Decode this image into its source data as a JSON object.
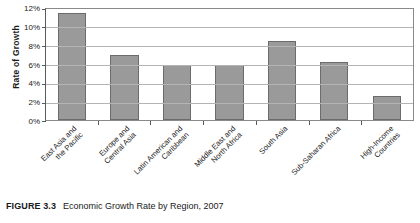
{
  "figure": {
    "id_label": "FIGURE 3.3",
    "title": "Economic Growth Rate by Region, 2007"
  },
  "colors": {
    "bar_fill": "#9a9a9a",
    "bar_stroke": "#6b6b6b",
    "gridline": "#b4b4b4",
    "axis": "#5a5a5a",
    "background": "#ffffff",
    "text": "#1a1a1a"
  },
  "chart_data": {
    "type": "bar",
    "title": "Economic Growth Rate by Region, 2007",
    "xlabel": "",
    "ylabel": "Rate of Growth",
    "ylim": [
      0,
      12
    ],
    "ytick_values": [
      0,
      2,
      4,
      6,
      8,
      10,
      12
    ],
    "ytick_labels": [
      "0%",
      "2%",
      "4%",
      "6%",
      "8%",
      "10%",
      "12%"
    ],
    "grid": true,
    "legend": false,
    "units": "percent",
    "categories": [
      "East Asia and the Pacific",
      "Europe and Central Asia",
      "Latin American and Caribbean",
      "Middle East and North Africa",
      "South Asia",
      "Sub-Saharan Africa",
      "High-Income Countries"
    ],
    "category_lines": [
      [
        "East Asia and",
        "the Pacific"
      ],
      [
        "Europe and",
        "Central Asia"
      ],
      [
        "Latin American and",
        "Caribbean"
      ],
      [
        "Middle East and",
        "North Africa"
      ],
      [
        "South Asia"
      ],
      [
        "Sub-Saharan Africa"
      ],
      [
        "High-Income",
        "Countries"
      ]
    ],
    "values": [
      11.4,
      6.9,
      5.8,
      5.8,
      8.4,
      6.2,
      2.6
    ]
  }
}
